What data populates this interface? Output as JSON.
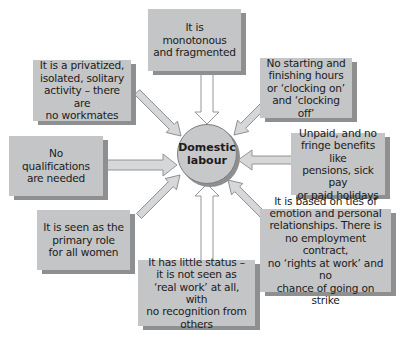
{
  "center": {
    "line1": "Domestic",
    "line2": "labour"
  },
  "boxes": [
    {
      "id": "top",
      "lines": [
        "It is",
        "monotonous",
        "and fragmented"
      ]
    },
    {
      "id": "top-left",
      "lines": [
        "It is a privatized,",
        "isolated, solitary",
        "activity – there are",
        "no workmates"
      ]
    },
    {
      "id": "top-right",
      "lines": [
        "No starting and",
        "finishing hours",
        "or ‘clocking on’",
        "and ‘clocking off’"
      ]
    },
    {
      "id": "left",
      "lines": [
        "No",
        "qualifications",
        "are needed"
      ]
    },
    {
      "id": "right",
      "lines": [
        "Unpaid, and no",
        "fringe benefits like",
        "pensions, sick pay",
        "or paid holidays"
      ]
    },
    {
      "id": "bottom-left",
      "lines": [
        "It is seen as the",
        "primary role",
        "for all women"
      ]
    },
    {
      "id": "bottom",
      "lines": [
        "It has little status –",
        "it is not seen as",
        "‘real work’ at all, with",
        "no recognition from",
        "others"
      ]
    },
    {
      "id": "bottom-right",
      "lines": [
        "It is based on ties of",
        "emotion and personal",
        "relationships. There is",
        "no employment contract,",
        "no ‘rights at work’ and no",
        "chance of going on strike"
      ]
    }
  ],
  "colors": {
    "box_fill": "#c4c5c6",
    "box_shadow": "#8e8f91",
    "arrow_fill": "#d4d5d6",
    "arrow_stroke": "#8a8b8d",
    "text": "#1b1b1b"
  }
}
